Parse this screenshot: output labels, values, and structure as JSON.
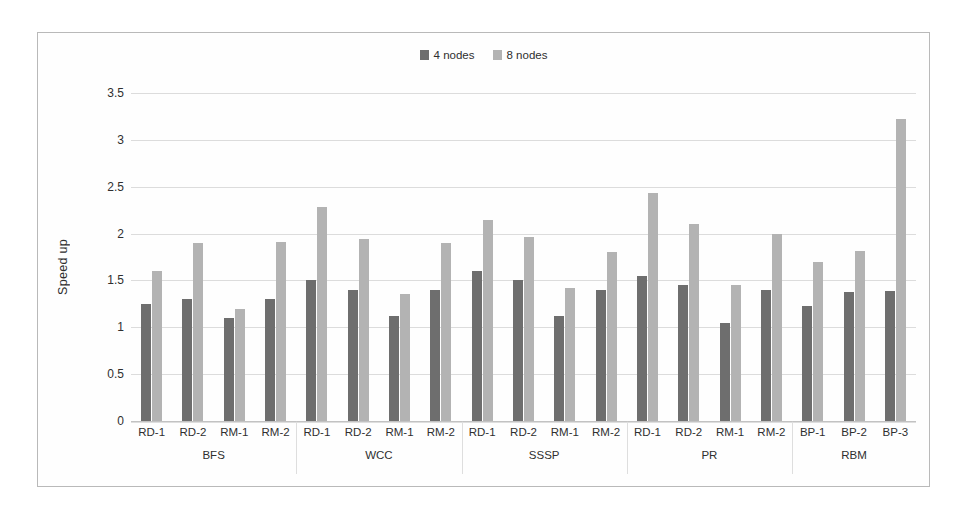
{
  "chart_data": {
    "type": "bar",
    "title": "",
    "xlabel": "",
    "ylabel": "Speed up",
    "ylim": [
      0,
      3.5
    ],
    "ytick_labels": [
      "3.5",
      "3",
      "2.5",
      "2",
      "1.5",
      "1",
      "0.5",
      "0"
    ],
    "ytick_values": [
      3.5,
      3,
      2.5,
      2,
      1.5,
      1,
      0.5,
      0
    ],
    "grid": true,
    "legend_position": "top-center",
    "series": [
      {
        "name": "4 nodes",
        "color": "#6e6e6e",
        "values": [
          1.25,
          1.3,
          1.1,
          1.3,
          1.5,
          1.4,
          1.12,
          1.4,
          1.6,
          1.5,
          1.12,
          1.4,
          1.55,
          1.45,
          1.05,
          1.4,
          1.23,
          1.38,
          1.39
        ]
      },
      {
        "name": "8 nodes",
        "color": "#b3b3b3",
        "values": [
          1.6,
          1.9,
          1.2,
          1.91,
          2.28,
          1.94,
          1.36,
          1.9,
          2.15,
          1.96,
          1.42,
          1.8,
          2.43,
          2.1,
          1.45,
          2.0,
          1.7,
          1.81,
          3.22
        ]
      }
    ],
    "categories": [
      "RD-1",
      "RD-2",
      "RM-1",
      "RM-2",
      "RD-1",
      "RD-2",
      "RM-1",
      "RM-2",
      "RD-1",
      "RD-2",
      "RM-1",
      "RM-2",
      "RD-1",
      "RD-2",
      "RM-1",
      "RM-2",
      "BP-1",
      "BP-2",
      "BP-3"
    ],
    "groups": [
      {
        "label": "BFS",
        "count": 4
      },
      {
        "label": "WCC",
        "count": 4
      },
      {
        "label": "SSSP",
        "count": 4
      },
      {
        "label": "PR",
        "count": 4
      },
      {
        "label": "RBM",
        "count": 3
      }
    ]
  },
  "legend": {
    "items": [
      {
        "label": "4 nodes",
        "color": "#6e6e6e"
      },
      {
        "label": "8 nodes",
        "color": "#b3b3b3"
      }
    ]
  }
}
